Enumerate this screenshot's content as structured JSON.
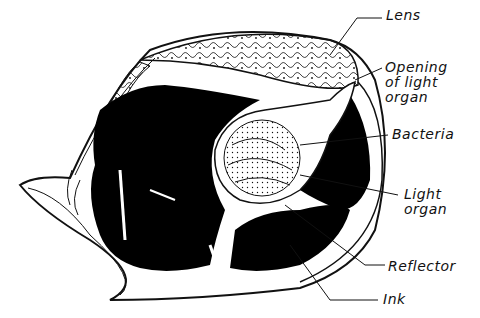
{
  "diagram": {
    "labels": [
      {
        "id": "lens",
        "text": "Lens"
      },
      {
        "id": "opening",
        "text": "Opening\nof light\norgan"
      },
      {
        "id": "bacteria",
        "text": "Bacteria"
      },
      {
        "id": "light-organ",
        "text": "Light\norgan"
      },
      {
        "id": "reflector",
        "text": "Reflector"
      },
      {
        "id": "ink",
        "text": "Ink"
      }
    ],
    "colors": {
      "ink": "#000000",
      "line": "#111111",
      "background": "#ffffff"
    }
  }
}
